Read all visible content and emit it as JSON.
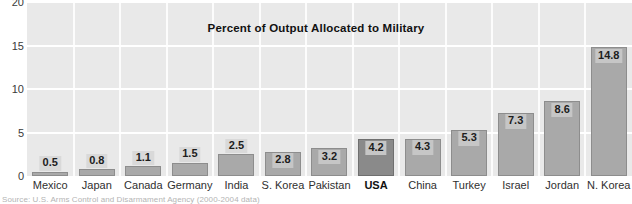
{
  "chart_data": {
    "type": "bar",
    "title": "Percent of Output Allocated to Military",
    "xlabel": "",
    "ylabel": "",
    "ylim": [
      0,
      20
    ],
    "yticks": [
      0,
      5,
      10,
      15,
      20
    ],
    "grid": "horizontal and vertical white gridlines",
    "legend": "none",
    "categories": [
      "Mexico",
      "Japan",
      "Canada",
      "Germany",
      "India",
      "S. Korea",
      "Pakistan",
      "USA",
      "China",
      "Turkey",
      "Israel",
      "Jordan",
      "N. Korea"
    ],
    "values": [
      0.5,
      0.8,
      1.1,
      1.5,
      2.5,
      2.8,
      3.2,
      4.2,
      4.3,
      5.3,
      7.3,
      8.6,
      14.8
    ],
    "value_labels": [
      "0.5",
      "0.8",
      "1.1",
      "1.5",
      "2.5",
      "2.8",
      "3.2",
      "4.2",
      "4.3",
      "5.3",
      "7.3",
      "8.6",
      "14.8"
    ],
    "highlight_category": "USA",
    "bar_color": "#a9a9a9",
    "highlight_color": "#8a8a8a",
    "plot_background": "#e9e9e9",
    "gridline_color": "#ffffff"
  },
  "axis": {
    "y_tick_labels": [
      "20",
      "15",
      "10",
      "5",
      "0"
    ]
  },
  "source": {
    "text": "Source:  U.S. Arms Control and Disarmament Agency  (2000-2004 data)"
  }
}
